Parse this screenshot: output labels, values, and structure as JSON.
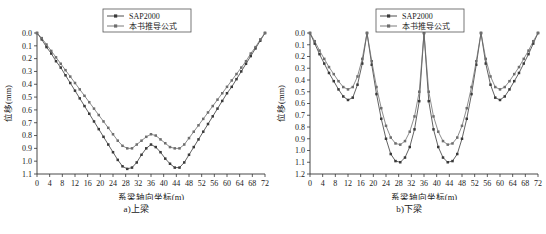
{
  "figure": {
    "panels": [
      {
        "id": "panel-a",
        "caption": "a)上梁",
        "legend": {
          "items": [
            {
              "label": "SAP2000",
              "color": "#3a3a3a",
              "marker": "square"
            },
            {
              "label": "本书推导公式",
              "color": "#6e6e6e",
              "marker": "square"
            }
          ]
        },
        "chart_data": {
          "type": "line",
          "title": "",
          "subtitle": "",
          "xlabel": "系梁轴向坐标(m)",
          "ylabel": "位移(mm)",
          "xlim": [
            0,
            72
          ],
          "ylim": [
            0,
            1.1
          ],
          "y_inverted": true,
          "grid": false,
          "legend_position": "top-center",
          "xticks": [
            0,
            4,
            8,
            12,
            16,
            20,
            24,
            28,
            32,
            36,
            40,
            44,
            48,
            52,
            56,
            60,
            64,
            68,
            72
          ],
          "yticks": [
            0.0,
            0.1,
            0.2,
            0.3,
            0.4,
            0.5,
            0.6,
            0.7,
            0.8,
            0.9,
            1.0,
            1.1
          ],
          "x": [
            0,
            1.5,
            3,
            4.5,
            6,
            7.5,
            9,
            10.5,
            12,
            13.5,
            15,
            16.5,
            18,
            19.5,
            21,
            22.5,
            24,
            25.5,
            27,
            28.5,
            30,
            31.5,
            33,
            34.5,
            36,
            37.5,
            39,
            40.5,
            42,
            43.5,
            45,
            46.5,
            48,
            49.5,
            51,
            52.5,
            54,
            55.5,
            57,
            58.5,
            60,
            61.5,
            63,
            64.5,
            66,
            67.5,
            69,
            70.5,
            72
          ],
          "series": [
            {
              "name": "SAP2000",
              "color": "#3a3a3a",
              "values": [
                0.0,
                0.05,
                0.11,
                0.16,
                0.22,
                0.27,
                0.33,
                0.39,
                0.45,
                0.51,
                0.57,
                0.63,
                0.69,
                0.75,
                0.81,
                0.87,
                0.93,
                0.99,
                1.04,
                1.06,
                1.05,
                1.01,
                0.95,
                0.9,
                0.87,
                0.89,
                0.93,
                0.98,
                1.02,
                1.05,
                1.05,
                1.01,
                0.95,
                0.89,
                0.83,
                0.77,
                0.71,
                0.65,
                0.59,
                0.53,
                0.47,
                0.42,
                0.36,
                0.3,
                0.24,
                0.18,
                0.12,
                0.06,
                0.0
              ]
            },
            {
              "name": "本书推导公式",
              "color": "#6e6e6e",
              "values": [
                0.0,
                0.04,
                0.09,
                0.14,
                0.19,
                0.24,
                0.29,
                0.34,
                0.39,
                0.44,
                0.49,
                0.54,
                0.59,
                0.64,
                0.69,
                0.74,
                0.79,
                0.84,
                0.88,
                0.9,
                0.9,
                0.87,
                0.84,
                0.81,
                0.79,
                0.8,
                0.83,
                0.86,
                0.89,
                0.9,
                0.9,
                0.87,
                0.82,
                0.77,
                0.72,
                0.67,
                0.62,
                0.57,
                0.52,
                0.47,
                0.42,
                0.37,
                0.32,
                0.27,
                0.22,
                0.16,
                0.11,
                0.05,
                0.0
              ]
            }
          ]
        }
      },
      {
        "id": "panel-b",
        "caption": "b)下梁",
        "legend": {
          "items": [
            {
              "label": "SAP2000",
              "color": "#3a3a3a",
              "marker": "square"
            },
            {
              "label": "本书推导公式",
              "color": "#6e6e6e",
              "marker": "square"
            }
          ]
        },
        "chart_data": {
          "type": "line",
          "title": "",
          "subtitle": "",
          "xlabel": "系梁轴向坐标(m)",
          "ylabel": "位移(mm)",
          "xlim": [
            0,
            72
          ],
          "ylim": [
            0,
            1.2
          ],
          "y_inverted": true,
          "grid": false,
          "legend_position": "top-center",
          "xticks": [
            0,
            4,
            8,
            12,
            16,
            20,
            24,
            28,
            32,
            36,
            40,
            44,
            48,
            52,
            56,
            60,
            64,
            68,
            72
          ],
          "yticks": [
            0.0,
            0.1,
            0.2,
            0.3,
            0.4,
            0.5,
            0.6,
            0.7,
            0.8,
            0.9,
            1.0,
            1.1,
            1.2
          ],
          "x": [
            0,
            1.5,
            3,
            4.5,
            6,
            7.5,
            9,
            10.5,
            12,
            13.5,
            15,
            16.5,
            18,
            19.5,
            21,
            22.5,
            24,
            25.5,
            27,
            28.5,
            30,
            31.5,
            33,
            34.5,
            36,
            37.5,
            39,
            40.5,
            42,
            43.5,
            45,
            46.5,
            48,
            49.5,
            51,
            52.5,
            54,
            55.5,
            57,
            58.5,
            60,
            61.5,
            63,
            64.5,
            66,
            67.5,
            69,
            70.5,
            72
          ],
          "series": [
            {
              "name": "SAP2000",
              "color": "#3a3a3a",
              "values": [
                0.0,
                0.09,
                0.18,
                0.26,
                0.34,
                0.41,
                0.48,
                0.54,
                0.57,
                0.55,
                0.44,
                0.26,
                0.0,
                0.27,
                0.52,
                0.73,
                0.9,
                1.03,
                1.09,
                1.1,
                1.06,
                0.97,
                0.82,
                0.58,
                0.0,
                0.58,
                0.82,
                0.97,
                1.06,
                1.1,
                1.09,
                1.03,
                0.9,
                0.73,
                0.52,
                0.27,
                0.0,
                0.26,
                0.44,
                0.55,
                0.57,
                0.54,
                0.48,
                0.41,
                0.34,
                0.26,
                0.18,
                0.09,
                0.0
              ]
            },
            {
              "name": "本书推导公式",
              "color": "#6e6e6e",
              "values": [
                0.0,
                0.07,
                0.15,
                0.22,
                0.29,
                0.35,
                0.41,
                0.46,
                0.48,
                0.46,
                0.37,
                0.22,
                0.0,
                0.24,
                0.46,
                0.64,
                0.79,
                0.89,
                0.94,
                0.95,
                0.92,
                0.84,
                0.71,
                0.5,
                0.0,
                0.5,
                0.71,
                0.84,
                0.92,
                0.95,
                0.94,
                0.89,
                0.79,
                0.64,
                0.46,
                0.24,
                0.0,
                0.22,
                0.37,
                0.46,
                0.48,
                0.46,
                0.41,
                0.35,
                0.29,
                0.22,
                0.15,
                0.07,
                0.0
              ]
            }
          ]
        }
      }
    ]
  }
}
